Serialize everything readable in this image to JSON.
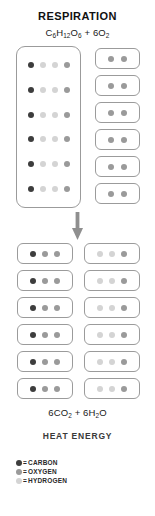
{
  "title": "RESPIRATION",
  "reactants_formula": {
    "glucose": "C6H12O6",
    "plus": "+",
    "oxygen": "6O2"
  },
  "products_formula": {
    "carbon_dioxide": "6CO2",
    "plus": "+",
    "water": "6H2O"
  },
  "heat_label": "HEAT ENERGY",
  "arrow": {
    "direction": "down",
    "name": "reaction-arrow"
  },
  "colors": {
    "carbon": "#3d3d3d",
    "oxygen": "#9a9a9a",
    "hydrogen": "#d4d4d4",
    "box_border": "#9b9b9b",
    "background": "#ffffff",
    "text": "#1a1a1a"
  },
  "reactants": {
    "glucose": {
      "label": "glucose-molecule",
      "rows": 6,
      "atoms_per_row": [
        "carbon",
        "hydrogen",
        "hydrogen",
        "oxygen"
      ]
    },
    "oxygen_molecules": {
      "label": "oxygen-molecule",
      "count": 6,
      "atoms": [
        "oxygen",
        "oxygen"
      ]
    }
  },
  "products": {
    "carbon_dioxide_molecules": {
      "label": "carbon-dioxide-molecule",
      "count": 6,
      "atoms": [
        "carbon",
        "oxygen",
        "oxygen"
      ]
    },
    "water_molecules": {
      "label": "water-molecule",
      "count": 6,
      "atoms": [
        "hydrogen",
        "hydrogen",
        "oxygen"
      ]
    }
  },
  "legend": {
    "equals": "=",
    "items": [
      {
        "key": "carbon",
        "label": "CARBON",
        "color": "#3d3d3d"
      },
      {
        "key": "oxygen",
        "label": "OXYGEN",
        "color": "#9a9a9a"
      },
      {
        "key": "hydrogen",
        "label": "HYDROGEN",
        "color": "#d4d4d4"
      }
    ]
  }
}
